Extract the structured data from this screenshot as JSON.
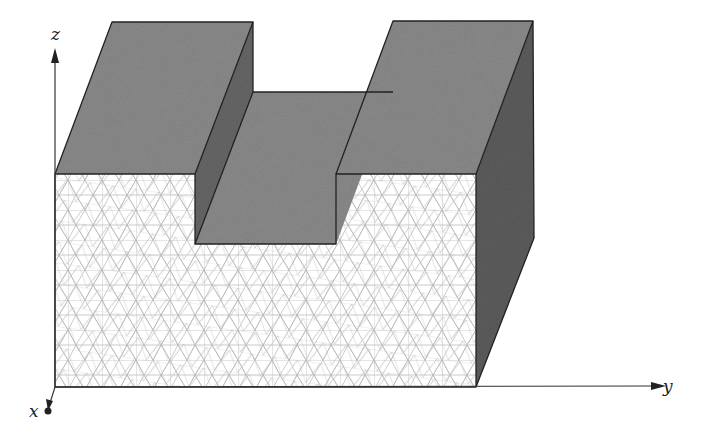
{
  "figure": {
    "type": "3d-mesh-diagram",
    "axes": {
      "x": {
        "label": "x"
      },
      "y": {
        "label": "y"
      },
      "z": {
        "label": "z"
      }
    },
    "colors": {
      "top_face": "#8a8a8a",
      "side_face": "#5c5c5c",
      "trench_wall": "#6a6a6a",
      "mesh_line": "#b5b5b5",
      "mesh_bg": "#ffffff",
      "edge": "#222222",
      "axis": "#333333"
    }
  }
}
